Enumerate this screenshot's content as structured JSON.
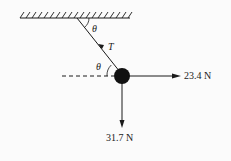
{
  "diagram": {
    "type": "free-body diagram",
    "ceiling": {
      "label": "ceiling (fixed support)"
    },
    "rope": {
      "label": "T",
      "description": "tension along rope toward ceiling"
    },
    "angles": {
      "top": "θ",
      "bottom": "θ"
    },
    "forces": {
      "horizontal": {
        "label": "23.4 N",
        "direction": "right"
      },
      "vertical": {
        "label": "31.7 N",
        "direction": "down"
      },
      "tension": {
        "label": "T",
        "direction": "up-left along rope"
      }
    },
    "colors": {
      "line": "#1a1a1a",
      "background": "#fbfbfb"
    }
  }
}
